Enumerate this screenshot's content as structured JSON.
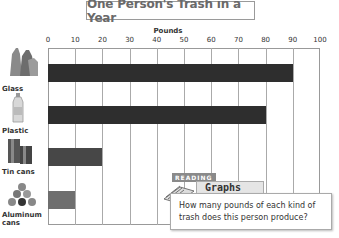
{
  "chart_data": {
    "type": "bar",
    "orientation": "horizontal",
    "title": "One Person's Trash in a Year",
    "xlabel": "Pounds",
    "ylabel": "",
    "categories": [
      "Glass",
      "Plastic",
      "Tin cans",
      "Aluminum cans"
    ],
    "values": [
      90,
      80,
      20,
      10
    ],
    "xlim": [
      0,
      100
    ],
    "xticks": [
      "0",
      "10",
      "20",
      "30",
      "40",
      "50",
      "60",
      "70",
      "80",
      "90",
      "100"
    ],
    "grid": true,
    "bar_colors": [
      "#2e2e2e",
      "#2e2e2e",
      "#474747",
      "#6e6e6e"
    ]
  },
  "callout": {
    "tag": "READING",
    "heading": "Graphs",
    "question": "How many pounds of each kind of trash does this person produce?"
  }
}
